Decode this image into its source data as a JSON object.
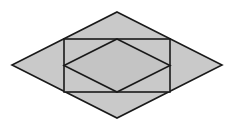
{
  "diagram": {
    "type": "geometry",
    "canvas": {
      "width": 237,
      "height": 128,
      "background": "#ffffff"
    },
    "colors": {
      "fill": "#c9c9c9",
      "inner_fill": "#c4c4c4",
      "stroke": "#1a1a1a"
    },
    "stroke_width": 1.6,
    "shapes": {
      "outer_rhombus": {
        "points": [
          [
            117,
            12
          ],
          [
            222,
            65
          ],
          [
            117,
            118
          ],
          [
            12,
            65
          ]
        ]
      },
      "rectangle": {
        "x": 64,
        "y": 39,
        "width": 106,
        "height": 53
      },
      "inner_rhombus": {
        "points": [
          [
            117,
            39
          ],
          [
            170,
            65.5
          ],
          [
            117,
            92
          ],
          [
            64,
            65.5
          ]
        ]
      }
    }
  }
}
